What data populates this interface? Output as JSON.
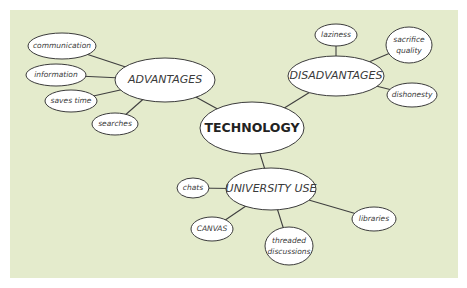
{
  "diagram": {
    "type": "mind-map",
    "background": "#e4ebcc",
    "center": {
      "label": "TECHNOLOGY",
      "cx": 252,
      "cy": 128,
      "rx": 52,
      "ry": 26
    },
    "branches": [
      {
        "label": "ADVANTAGES",
        "cx": 165,
        "cy": 80,
        "rx": 50,
        "ry": 22,
        "leaves": [
          {
            "label": "communication",
            "cx": 62,
            "cy": 46,
            "rx": 34,
            "ry": 13
          },
          {
            "label": "information",
            "cx": 56,
            "cy": 75,
            "rx": 30,
            "ry": 11
          },
          {
            "label": "saves time",
            "cx": 71,
            "cy": 101,
            "rx": 26,
            "ry": 11
          },
          {
            "label": "searches",
            "cx": 115,
            "cy": 124,
            "rx": 23,
            "ry": 11
          }
        ]
      },
      {
        "label": "DISADVANTAGES",
        "cx": 336,
        "cy": 76,
        "rx": 48,
        "ry": 20,
        "leaves": [
          {
            "label": "laziness",
            "cx": 336,
            "cy": 35,
            "rx": 21,
            "ry": 11
          },
          {
            "label": "sacrifice quality",
            "cx": 409,
            "cy": 45,
            "rx": 23,
            "ry": 18
          },
          {
            "label": "dishonesty",
            "cx": 412,
            "cy": 95,
            "rx": 25,
            "ry": 12
          }
        ]
      },
      {
        "label": "UNIVERSITY USE",
        "cx": 271,
        "cy": 189,
        "rx": 45,
        "ry": 21,
        "leaves": [
          {
            "label": "chats",
            "cx": 193,
            "cy": 188,
            "rx": 16,
            "ry": 10
          },
          {
            "label": "CANVAS",
            "cx": 212,
            "cy": 229,
            "rx": 21,
            "ry": 12
          },
          {
            "label": "threaded discussions",
            "cx": 289,
            "cy": 246,
            "rx": 24,
            "ry": 19
          },
          {
            "label": "libraries",
            "cx": 374,
            "cy": 219,
            "rx": 22,
            "ry": 12
          }
        ]
      }
    ]
  }
}
